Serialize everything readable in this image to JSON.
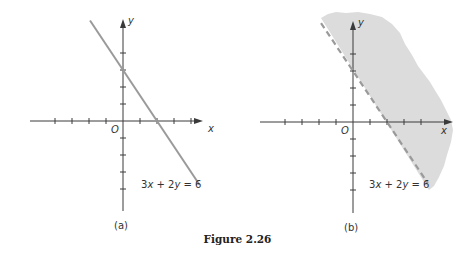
{
  "figure": {
    "caption": "Figure 2.26"
  },
  "panels": [
    {
      "id": "a",
      "label": "(a)",
      "origin_px": [
        123,
        121
      ],
      "unit_px": 17,
      "x_axis_px": [
        30,
        203
      ],
      "y_axis_px": [
        20,
        211
      ],
      "x_ticks": [
        -4,
        -3,
        -2,
        -1,
        1,
        2,
        3,
        4
      ],
      "y_ticks": [
        -4,
        -3,
        -2,
        -1,
        1,
        2,
        3,
        4
      ],
      "axis_labels": {
        "x": "x",
        "y": "y",
        "origin": "O"
      },
      "line": {
        "equation": "3x + 2y = 6",
        "style": "solid",
        "x_range": [
          -1.94,
          4.5
        ]
      },
      "shaded": false,
      "equation_label_pos": [
        141,
        188
      ],
      "panel_label_pos": [
        117,
        228
      ]
    },
    {
      "id": "b",
      "label": "(b)",
      "origin_px": [
        353,
        122
      ],
      "unit_px": 17,
      "x_axis_px": [
        260,
        452
      ],
      "y_axis_px": [
        22,
        213
      ],
      "x_ticks": [
        -4,
        -3,
        -2,
        -1,
        1,
        2,
        3,
        4
      ],
      "y_ticks": [
        -4,
        -3,
        -2,
        -1,
        1,
        2,
        3,
        4
      ],
      "axis_labels": {
        "x": "x",
        "y": "y",
        "origin": "O"
      },
      "line": {
        "equation": "3x + 2y = 6",
        "style": "dashed",
        "x_range": [
          -1.88,
          4.4
        ]
      },
      "shaded": true,
      "shade_region": "3x + 2y > 6",
      "equation_label_pos": [
        369,
        188
      ],
      "panel_label_pos": [
        347,
        230
      ]
    }
  ],
  "colors": {
    "axis": "#3a3a3a",
    "line": "#9a9a9a",
    "shade": "#dcdcdc",
    "text": "#333333"
  }
}
